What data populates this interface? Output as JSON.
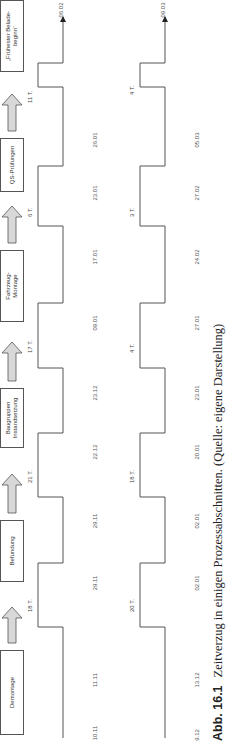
{
  "figure": {
    "process_steps": [
      {
        "label": "Demontage"
      },
      {
        "label": "Befundung"
      },
      {
        "label": "Baugruppen-\nInstandsetzung",
        "line1": "Baugruppen",
        "line2": "Instandsetzung"
      },
      {
        "label": "Fahrzeug-Montage",
        "line1": "Fahrzeug-",
        "line2": "Montage"
      },
      {
        "label": "QS-Prüfungen"
      },
      {
        "label": "„Frühester Belade-beginn“",
        "line1": "„Frühester Belade-",
        "line2": "beginn“"
      }
    ],
    "timelines": [
      {
        "name": "upper",
        "delays": [
          "18 T.",
          "21 T.",
          "17 T.",
          "6 T.",
          "11 T."
        ],
        "dates": [
          "10.11",
          "11.11",
          "29.11",
          "29.11",
          "22.12",
          "23.12",
          "09.01",
          "17.01",
          "23.01",
          "26.01"
        ],
        "end_date": "06.02"
      },
      {
        "name": "lower",
        "delays": [
          "20 T.",
          "18 T.",
          "4 T.",
          "3 T.",
          "4 T."
        ],
        "dates": [
          "9.12",
          "13.12",
          "02.01",
          "02.01",
          "20.01",
          "23.01",
          "27.01",
          "24.02",
          "27.02",
          "05.03"
        ],
        "end_date": "09.03"
      }
    ],
    "caption": {
      "number": "Abb. 16.1",
      "text": "Zeitverzug in einigen Prozessabschnitten. (Quelle: eigene Darstellung)"
    }
  }
}
